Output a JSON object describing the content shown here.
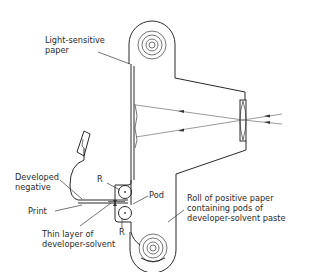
{
  "diagram": {
    "type": "instant camera cross-section (diffusion transfer process)",
    "labels": {
      "light_sensitive_paper": "Light-sensitive\npaper",
      "developed_negative": "Developed\nnegative",
      "print": "Print",
      "roller_top": "R",
      "roller_bottom": "R",
      "pod": "Pod",
      "thin_layer": "Thin layer of\ndeveloper-solvent",
      "roll_positive": "Roll of positive paper\ncontaining pods of\ndeveloper-solvent paste"
    },
    "components": [
      {
        "name": "negative-roll",
        "description": "roll of light-sensitive paper (top)"
      },
      {
        "name": "positive-roll",
        "description": "roll of positive paper with pods (bottom)"
      },
      {
        "name": "lens",
        "description": "lens on right side of camera body"
      },
      {
        "name": "rollers",
        "description": "two pressure rollers R"
      },
      {
        "name": "light-rays",
        "description": "rays passing through lens focusing image on paper"
      }
    ],
    "colors": {
      "line": "#2a2a2a",
      "background": "#ffffff"
    }
  }
}
